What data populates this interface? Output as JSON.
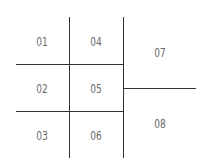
{
  "diagram": {
    "cells": [
      {
        "id": "01",
        "label": "01"
      },
      {
        "id": "02",
        "label": "02"
      },
      {
        "id": "03",
        "label": "03"
      },
      {
        "id": "04",
        "label": "04"
      },
      {
        "id": "05",
        "label": "05"
      },
      {
        "id": "06",
        "label": "06"
      },
      {
        "id": "07",
        "label": "07"
      },
      {
        "id": "08",
        "label": "08"
      }
    ],
    "line_color": "#333333",
    "text_color": "#6a6a6a"
  }
}
